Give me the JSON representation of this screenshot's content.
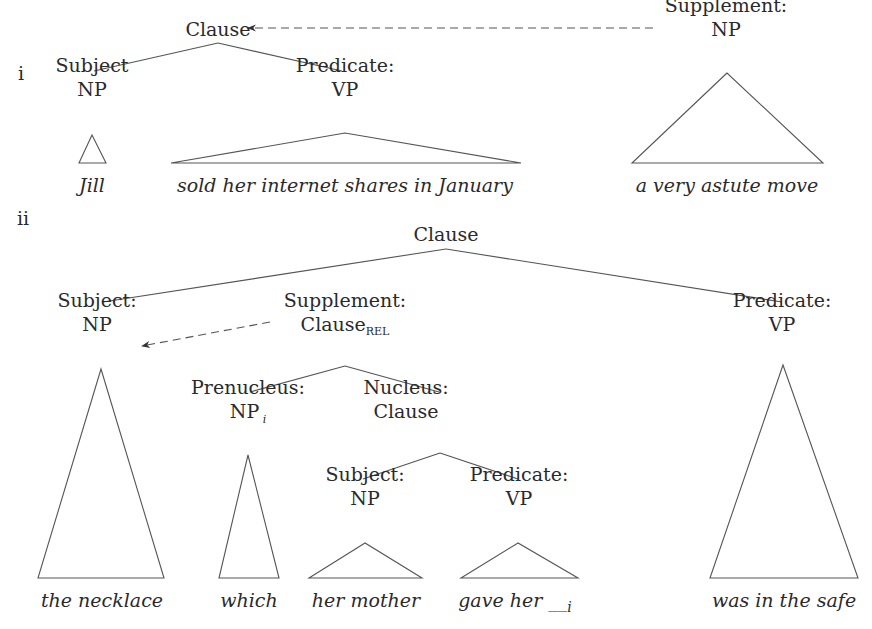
{
  "examples": [
    {
      "marker": "i",
      "marker_pos": [
        18,
        80
      ],
      "nodes": [
        {
          "id": "i-clause",
          "lines": [
            "Clause"
          ],
          "x": 218,
          "y": 36
        },
        {
          "id": "i-subject",
          "lines": [
            "Subject",
            "NP"
          ],
          "x": 92,
          "y": 96
        },
        {
          "id": "i-predicate",
          "lines": [
            "Predicate:",
            "VP"
          ],
          "x": 345,
          "y": 96
        },
        {
          "id": "i-supplement",
          "lines": [
            "Supplement:",
            "NP"
          ],
          "x": 726,
          "y": 36
        }
      ],
      "edges": [
        {
          "from": [
            218,
            43
          ],
          "to": [
            94,
            71
          ]
        },
        {
          "from": [
            218,
            43
          ],
          "to": [
            342,
            71
          ]
        }
      ],
      "triangles": [
        {
          "apex": [
            92,
            135
          ],
          "left": 79,
          "right": 106,
          "base": 163
        },
        {
          "apex": [
            345,
            133
          ],
          "left": 171,
          "right": 521,
          "base": 163
        },
        {
          "apex": [
            727,
            73
          ],
          "left": 632,
          "right": 823,
          "base": 163
        }
      ],
      "words": [
        {
          "text": "Jill",
          "x": 92,
          "y": 192
        },
        {
          "text": "sold her internet shares in January",
          "x": 345,
          "y": 192
        },
        {
          "text": "a very astute move",
          "x": 727,
          "y": 192
        }
      ],
      "dashed_arrows": [
        {
          "from": [
            653,
            28
          ],
          "to": [
            248,
            28
          ]
        }
      ]
    },
    {
      "marker": "ii",
      "marker_pos": [
        17,
        225
      ],
      "nodes": [
        {
          "id": "ii-clause",
          "lines": [
            "Clause"
          ],
          "x": 446,
          "y": 241
        },
        {
          "id": "ii-subject",
          "lines": [
            "Subject:",
            "NP"
          ],
          "x": 97,
          "y": 331
        },
        {
          "id": "ii-supplement",
          "lines": [
            "Supplement:",
            "Clause"
          ],
          "sub": "REL",
          "x": 345,
          "y": 331
        },
        {
          "id": "ii-predicate",
          "lines": [
            "Predicate:",
            "VP"
          ],
          "x": 782,
          "y": 331
        },
        {
          "id": "ii-prenucleus",
          "lines": [
            "Prenucleus:",
            "NP"
          ],
          "sub_italic": "i",
          "x": 248,
          "y": 418
        },
        {
          "id": "ii-nucleus",
          "lines": [
            "Nucleus:",
            "Clause"
          ],
          "x": 406,
          "y": 418
        },
        {
          "id": "ii-nucleus-subject",
          "lines": [
            "Subject:",
            "NP"
          ],
          "x": 365,
          "y": 505
        },
        {
          "id": "ii-nucleus-predicate",
          "lines": [
            "Predicate:",
            "VP"
          ],
          "x": 519,
          "y": 505
        }
      ],
      "edges": [
        {
          "from": [
            446,
            249
          ],
          "to": [
            103,
            302
          ]
        },
        {
          "from": [
            446,
            249
          ],
          "to": [
            782,
            302
          ]
        },
        {
          "from": [
            345,
            366
          ],
          "to": [
            250,
            392
          ]
        },
        {
          "from": [
            345,
            366
          ],
          "to": [
            439,
            392
          ]
        },
        {
          "from": [
            440,
            453
          ],
          "to": [
            363,
            479
          ]
        },
        {
          "from": [
            440,
            453
          ],
          "to": [
            518,
            479
          ]
        }
      ],
      "triangles": [
        {
          "apex": [
            101,
            369
          ],
          "left": 38,
          "right": 164,
          "base": 578
        },
        {
          "apex": [
            248,
            455
          ],
          "left": 219,
          "right": 279,
          "base": 578
        },
        {
          "apex": [
            365,
            543
          ],
          "left": 309,
          "right": 422,
          "base": 578
        },
        {
          "apex": [
            518,
            543
          ],
          "left": 461,
          "right": 578,
          "base": 578
        },
        {
          "apex": [
            783,
            365
          ],
          "left": 710,
          "right": 858,
          "base": 578
        }
      ],
      "words": [
        {
          "text": "the necklace",
          "x": 102,
          "y": 607
        },
        {
          "text": "which",
          "x": 249,
          "y": 607
        },
        {
          "text": "her mother",
          "x": 366,
          "y": 607
        },
        {
          "text": "gave her __",
          "sub_italic": "i",
          "x": 515,
          "y": 607
        },
        {
          "text": "was in the safe",
          "x": 784,
          "y": 607
        }
      ],
      "dashed_arrows": [
        {
          "from": [
            270,
            322
          ],
          "to": [
            142,
            346
          ]
        }
      ]
    }
  ]
}
